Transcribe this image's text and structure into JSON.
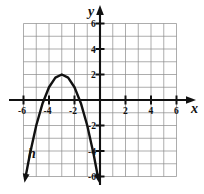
{
  "figure": {
    "background_color": "#ffffff",
    "grid_color": "#8a8a8a",
    "axis_color": "#111111",
    "curve_color": "#111111"
  },
  "chart_data": {
    "type": "line",
    "title": "",
    "subtitle": "",
    "xlabel": "x",
    "ylabel": "y",
    "xlim": [
      -6,
      6
    ],
    "ylim": [
      -6,
      6
    ],
    "grid": true,
    "grid_step": 1,
    "legend_position": "none",
    "x_tick_labels": [
      "-6",
      "-4",
      "-2",
      "2",
      "4",
      "6"
    ],
    "x_tick_values": [
      -6,
      -4,
      -2,
      2,
      4,
      6
    ],
    "y_tick_labels": [
      "6",
      "4",
      "2",
      "-2",
      "-4",
      "-6"
    ],
    "y_tick_values": [
      6,
      4,
      2,
      -2,
      -4,
      -6
    ],
    "annotations": [
      {
        "text": "h",
        "x": -5.2,
        "y": -4.2
      },
      {
        "text": "y",
        "x": 0.0,
        "y": 6.9
      },
      {
        "text": "x",
        "x": 6.9,
        "y": -0.7
      }
    ],
    "series": [
      {
        "name": "h",
        "kind": "parabola",
        "opens": "down",
        "vertex": [
          -3,
          2
        ],
        "roots": [
          -4.4,
          -1.6
        ],
        "leading_coefficient": -1,
        "equation": "h(x) = -(x + 3)^2 + 2",
        "arrow_start": true,
        "arrow_end": true,
        "x": [
          -5.85,
          -5.5,
          -5.0,
          -4.5,
          -4.0,
          -3.5,
          -3.0,
          -2.5,
          -2.0,
          -1.5,
          -1.0,
          -0.5,
          -0.15
        ],
        "values": [
          -6.1,
          -4.25,
          -2.0,
          -0.25,
          1.0,
          1.75,
          2.0,
          1.75,
          1.0,
          -0.25,
          -2.0,
          -4.25,
          -6.1
        ]
      }
    ]
  }
}
